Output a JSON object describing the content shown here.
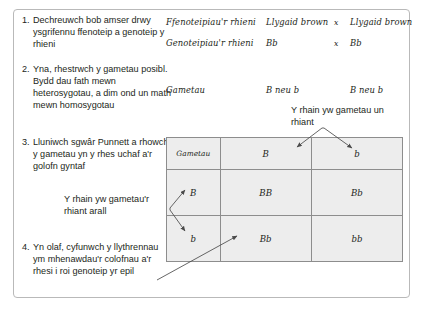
{
  "steps": [
    {
      "num": "1.",
      "text": "Dechreuwch bob amser drwy ysgrifennu ffenoteip a genoteip y rhieni"
    },
    {
      "num": "2.",
      "text": "Yna, rhestrwch y gametau posibl. Bydd dau fath mewn heterosygotau, a dim ond un math mewn homosygotau"
    },
    {
      "num": "3.",
      "text": "Lluniwch sgwâr Punnett a rhowch y gametau yn y rhes uchaf a'r golofn gyntaf"
    },
    {
      "num": "4.",
      "text": "Yn olaf, cyfunwch y llythrennau ym mhenawdau'r colofnau a'r rhesi i roi genoteip yr epil"
    }
  ],
  "cross": {
    "phenotype_label": "Ffenoteipiau'r rhieni",
    "phenotype_parent1": "Llygaid brown",
    "phenotype_cross_symbol": "x",
    "phenotype_parent2": "Llygaid brown",
    "genotype_label": "Genoteipiau'r rhieni",
    "genotype_parent1": "Bb",
    "genotype_cross_symbol": "x",
    "genotype_parent2": "Bb",
    "gametes_label": "Gametau",
    "gametes_parent1": "B neu b",
    "gametes_parent2": "B neu b"
  },
  "annotations": {
    "top": "Y rhain yw gametau un rhiant",
    "left": "Y rhain yw gametau'r rhiant arall"
  },
  "punnett": {
    "corner_label": "Gametau",
    "column_headers": [
      "B",
      "b"
    ],
    "row_headers": [
      "B",
      "b"
    ],
    "cells": [
      [
        "BB",
        "Bb"
      ],
      [
        "Bb",
        "bb"
      ]
    ]
  },
  "colors": {
    "frame_border": "#b9b9b9",
    "table_fill": "#ededed",
    "table_border": "#8d8d8d",
    "text": "#231f20",
    "arrow": "#4a4a4a"
  }
}
